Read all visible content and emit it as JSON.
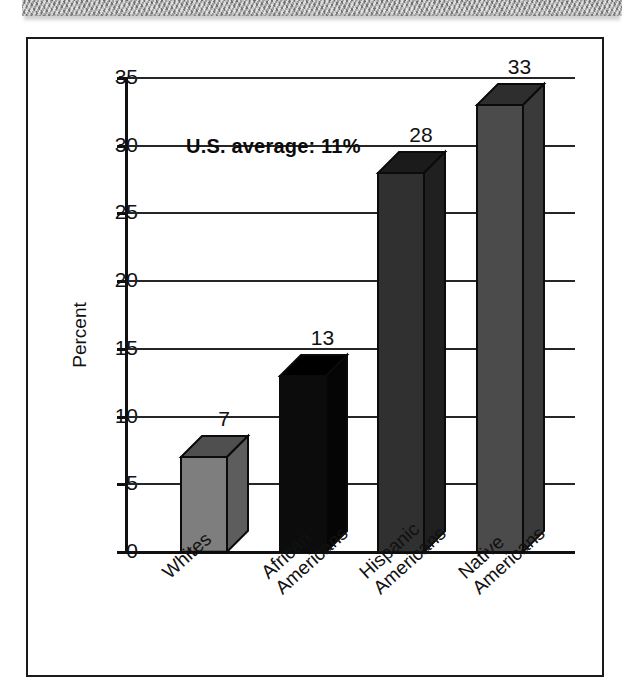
{
  "figure": {
    "annotation": "U.S. average: 11%"
  },
  "chart_data": {
    "type": "bar",
    "title": "",
    "subtitle": "",
    "xlabel": "",
    "ylabel": "Percent",
    "ylim": [
      0,
      35
    ],
    "yticks": [
      0,
      5,
      10,
      15,
      20,
      25,
      30,
      35
    ],
    "ytick_labels": [
      "0",
      "5",
      "10",
      "15",
      "20",
      "25",
      "30",
      "35"
    ],
    "grid": true,
    "legend": "none",
    "annotations": [
      "U.S. average: 11%"
    ],
    "categories": [
      "Whites",
      "African Americans",
      "Hispanic Americans",
      "Native Americans"
    ],
    "category_lines": [
      [
        "Whites"
      ],
      [
        "African",
        "Americans"
      ],
      [
        "Hispanic",
        "Americans"
      ],
      [
        "Native",
        "Americans"
      ]
    ],
    "values": [
      7,
      13,
      28,
      33
    ],
    "value_labels": [
      "7",
      "13",
      "28",
      "33"
    ],
    "bar_colors": [
      "#7e7e7e",
      "#0c0c0c",
      "#303030",
      "#4b4b4b"
    ],
    "bar_top_colors": [
      "#4f4f4f",
      "#000000",
      "#1b1b1b",
      "#2e2e2e"
    ],
    "bar_side_colors": [
      "#5d5d5d",
      "#050505",
      "#202020",
      "#3a3a3a"
    ]
  },
  "icons": {
    "scan_band": "page-edge-texture"
  }
}
